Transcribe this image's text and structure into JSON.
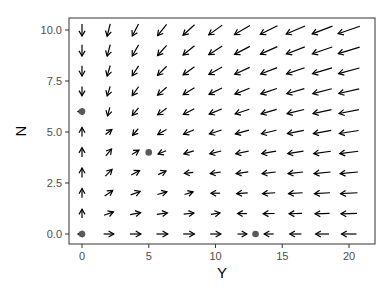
{
  "chart_data": {
    "type": "vector_field",
    "title": "",
    "xlabel": "Y",
    "ylabel": "N",
    "xlim": [
      -1,
      22
    ],
    "ylim": [
      -0.5,
      10.5
    ],
    "x_ticks": [
      0,
      5,
      10,
      15,
      20
    ],
    "x_tick_labels": [
      "0",
      "5",
      "10",
      "15",
      "20"
    ],
    "y_ticks": [
      0,
      2.5,
      5,
      7.5,
      10
    ],
    "y_tick_labels": [
      "0.0",
      "2.5",
      "5.0",
      "7.5",
      "10.0"
    ],
    "grid": false,
    "grid_x": [
      0,
      2,
      4,
      6,
      8,
      10,
      12,
      14,
      16,
      18,
      20
    ],
    "grid_y": [
      0,
      1,
      2,
      3,
      4,
      5,
      6,
      7,
      8,
      9,
      10
    ],
    "field": {
      "dY": "Y*(13 - Y - 2*N)",
      "dN": "N*(6 - N - 0.4*Y)"
    },
    "equilibria": [
      {
        "Y": 0,
        "N": 0
      },
      {
        "Y": 13,
        "N": 0
      },
      {
        "Y": 0,
        "N": 6
      },
      {
        "Y": 5,
        "N": 4
      }
    ],
    "colors": {
      "arrow": "#000000",
      "point": "#595959",
      "panel_border": "#333333",
      "tick_label": "#4d4d4d"
    }
  }
}
